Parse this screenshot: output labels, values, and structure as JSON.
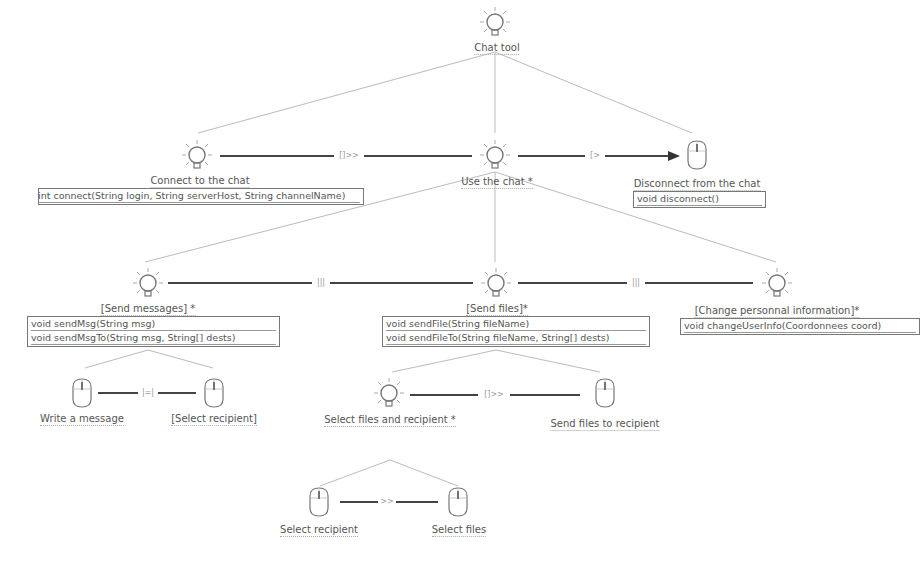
{
  "diagram": {
    "type": "task-model-tree",
    "colors": {
      "line": "#bbbbbb",
      "link": "#444444",
      "icon": "#777777",
      "box_border": "#777777"
    },
    "nodes": [
      {
        "id": "chat_tool",
        "label": "Chat tool",
        "kind": "abstract",
        "icon": "lightbulb-icon"
      },
      {
        "id": "connect",
        "label": "Connect to the chat",
        "kind": "abstract",
        "icon": "lightbulb-icon",
        "methods": [
          "int connect(String login, String serverHost, String channelName)"
        ]
      },
      {
        "id": "use",
        "label": "Use the chat *",
        "kind": "abstract",
        "icon": "lightbulb-icon"
      },
      {
        "id": "disconnect",
        "label": "Disconnect from the chat",
        "kind": "interaction",
        "icon": "mouse-icon",
        "methods": [
          "void disconnect()"
        ]
      },
      {
        "id": "send_messages",
        "label": "[Send messages] *",
        "kind": "abstract",
        "icon": "lightbulb-icon",
        "methods": [
          "void sendMsg(String msg)",
          "void sendMsgTo(String msg, String[] dests)"
        ]
      },
      {
        "id": "send_files",
        "label": "[Send files]*",
        "kind": "abstract",
        "icon": "lightbulb-icon",
        "methods": [
          "void sendFile(String fileName)",
          "void sendFileTo(String fileName, String[] dests)"
        ]
      },
      {
        "id": "change_info",
        "label": "[Change personnal information]*",
        "kind": "abstract",
        "icon": "lightbulb-icon",
        "methods": [
          "void changeUserInfo(Coordonnees coord)"
        ]
      },
      {
        "id": "write_message",
        "label": "Write a message",
        "kind": "interaction",
        "icon": "mouse-icon"
      },
      {
        "id": "select_recipient_1",
        "label": "[Select recipient]",
        "kind": "interaction",
        "icon": "mouse-icon"
      },
      {
        "id": "select_files_recipient",
        "label": "Select files and recipient *",
        "kind": "abstract",
        "icon": "lightbulb-icon"
      },
      {
        "id": "send_files_recipient",
        "label": "Send files to recipient",
        "kind": "interaction",
        "icon": "mouse-icon"
      },
      {
        "id": "select_recipient_2",
        "label": "Select recipient",
        "kind": "interaction",
        "icon": "mouse-icon"
      },
      {
        "id": "select_files",
        "label": "Select files",
        "kind": "interaction",
        "icon": "mouse-icon"
      }
    ],
    "edges": [
      {
        "from": "chat_tool",
        "to": "connect",
        "type": "hierarchy"
      },
      {
        "from": "chat_tool",
        "to": "use",
        "type": "hierarchy"
      },
      {
        "from": "chat_tool",
        "to": "disconnect",
        "type": "hierarchy"
      },
      {
        "from": "use",
        "to": "send_messages",
        "type": "hierarchy"
      },
      {
        "from": "use",
        "to": "send_files",
        "type": "hierarchy"
      },
      {
        "from": "use",
        "to": "change_info",
        "type": "hierarchy"
      },
      {
        "from": "send_messages",
        "to": "write_message",
        "type": "hierarchy"
      },
      {
        "from": "send_messages",
        "to": "select_recipient_1",
        "type": "hierarchy"
      },
      {
        "from": "send_files",
        "to": "select_files_recipient",
        "type": "hierarchy"
      },
      {
        "from": "send_files",
        "to": "send_files_recipient",
        "type": "hierarchy"
      },
      {
        "from": "select_files_recipient",
        "to": "select_recipient_2",
        "type": "hierarchy"
      },
      {
        "from": "select_files_recipient",
        "to": "select_files",
        "type": "hierarchy"
      }
    ],
    "operators": [
      {
        "from": "connect",
        "to": "use",
        "symbol": "[]>>"
      },
      {
        "from": "use",
        "to": "disconnect",
        "symbol": "[>"
      },
      {
        "from": "send_messages",
        "to": "send_files",
        "symbol": "|||"
      },
      {
        "from": "send_files",
        "to": "change_info",
        "symbol": "|||"
      },
      {
        "from": "write_message",
        "to": "select_recipient_1",
        "symbol": "|=|"
      },
      {
        "from": "select_files_recipient",
        "to": "send_files_recipient",
        "symbol": "[]>>"
      },
      {
        "from": "select_recipient_2",
        "to": "select_files",
        "symbol": ">>"
      }
    ]
  },
  "labels": {
    "chat_tool": "Chat tool",
    "connect": "Connect to the chat",
    "connect_m1": "int connect(String login, String serverHost, String channelName)",
    "use": "Use the chat *",
    "disconnect": "Disconnect from the chat",
    "disconnect_m1": "void disconnect()",
    "send_messages": "[Send messages] *",
    "send_messages_m1": "void sendMsg(String msg)",
    "send_messages_m2": "void sendMsgTo(String msg, String[] dests)",
    "send_files": "[Send files]*",
    "send_files_m1": "void sendFile(String fileName)",
    "send_files_m2": "void sendFileTo(String fileName, String[] dests)",
    "change_info": "[Change personnal information]*",
    "change_info_m1": "void changeUserInfo(Coordonnees coord)",
    "write_message": "Write a message",
    "select_recipient_1": "[Select recipient]",
    "select_files_recipient": "Select files and recipient *",
    "send_files_recipient": "Send files to recipient",
    "select_recipient_2": "Select recipient",
    "select_files": "Select files"
  },
  "ops": {
    "connect_use": "[]>>",
    "use_disconnect": "[>",
    "msgs_files": "|||",
    "files_info": "|||",
    "write_select": "|=|",
    "sfr_send": "[]>>",
    "sel_files": ">>"
  }
}
